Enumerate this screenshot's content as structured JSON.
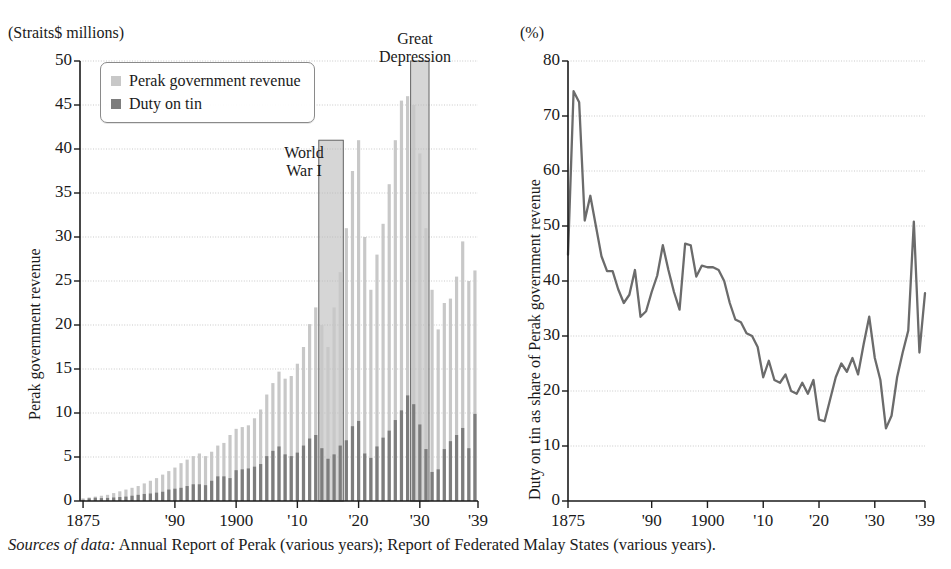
{
  "figure": {
    "source_note_lead": "Sources of data:",
    "source_note_rest": " Annual Report of Perak (various years); Report of Federated Malay States (various years)."
  },
  "colors": {
    "revenue_bar": "#c8c8c8",
    "duty_bar": "#7d7d7d",
    "band_shade": "#b4b4b4",
    "line": "#6b6b6b",
    "axis": "#1a1a1a",
    "grid": "#c9c9c9"
  },
  "left_panel": {
    "unit_label": "(Straits$ millions)",
    "y_axis_title": "Perak government revenue",
    "legend": [
      {
        "label": "Perak government revenue",
        "color_key": "revenue_bar"
      },
      {
        "label": "Duty on tin",
        "color_key": "duty_bar"
      }
    ],
    "annotations": [
      {
        "name": "world-war-one",
        "lines": [
          "World",
          "War I"
        ]
      },
      {
        "name": "great-depression",
        "lines": [
          "Great",
          "Depression"
        ]
      }
    ]
  },
  "right_panel": {
    "unit_label": "(%)",
    "y_axis_title": "Duty on tin as share of Perak government revenue"
  },
  "chart_data": [
    {
      "type": "bar",
      "name": "perak-revenue-and-tin-duty",
      "title": "",
      "xlabel": "",
      "ylabel": "Perak government revenue",
      "unit": "Straits$ millions",
      "ylim": [
        0,
        50
      ],
      "yticks": [
        0,
        5,
        10,
        15,
        20,
        25,
        30,
        35,
        40,
        45,
        50
      ],
      "ytick_labels": [
        "0",
        "5",
        "10",
        "15",
        "20",
        "25",
        "30",
        "35",
        "40",
        "45",
        "50"
      ],
      "xlim": [
        1875,
        1939
      ],
      "xticks": [
        1875,
        1890,
        1900,
        1910,
        1920,
        1930,
        1939
      ],
      "xtick_labels": [
        "1875",
        "'90",
        "1900",
        "'10",
        "'20",
        "'30",
        "'39"
      ],
      "grid": true,
      "legend_position": "upper-left",
      "shaded_bands": [
        {
          "label": "World War I",
          "x_start": 1914,
          "x_end": 1918,
          "y_top": 41
        },
        {
          "label": "Great Depression",
          "x_start": 1929,
          "x_end": 1932,
          "y_top": 50
        }
      ],
      "x": [
        1875,
        1876,
        1877,
        1878,
        1879,
        1880,
        1881,
        1882,
        1883,
        1884,
        1885,
        1886,
        1887,
        1888,
        1889,
        1890,
        1891,
        1892,
        1893,
        1894,
        1895,
        1896,
        1897,
        1898,
        1899,
        1900,
        1901,
        1902,
        1903,
        1904,
        1905,
        1906,
        1907,
        1908,
        1909,
        1910,
        1911,
        1912,
        1913,
        1914,
        1915,
        1916,
        1917,
        1918,
        1919,
        1920,
        1921,
        1922,
        1923,
        1924,
        1925,
        1926,
        1927,
        1928,
        1929,
        1930,
        1931,
        1932,
        1933,
        1934,
        1935,
        1936,
        1937,
        1938,
        1939
      ],
      "series": [
        {
          "name": "Perak government revenue",
          "color_key": "revenue_bar",
          "values": [
            0.3,
            0.4,
            0.5,
            0.6,
            0.7,
            0.9,
            1.1,
            1.3,
            1.5,
            1.7,
            2.0,
            2.3,
            2.6,
            3.0,
            3.4,
            3.8,
            4.3,
            4.7,
            5.1,
            5.4,
            5.1,
            5.6,
            6.3,
            6.6,
            7.5,
            8.2,
            8.4,
            8.6,
            9.4,
            10.4,
            12.1,
            13.4,
            14.7,
            13.9,
            14.2,
            15.6,
            17.5,
            20.1,
            22.0,
            20.0,
            17.5,
            22.0,
            26.0,
            31.0,
            37.5,
            41.0,
            30.0,
            24.0,
            28.0,
            31.5,
            36.0,
            41.0,
            45.5,
            46.0,
            45.0,
            39.5,
            31.0,
            24.0,
            19.5,
            22.5,
            23.0,
            25.5,
            29.5,
            25.0,
            26.2
          ]
        },
        {
          "name": "Duty on tin",
          "color_key": "duty_bar",
          "values": [
            0.14,
            0.3,
            0.37,
            0.33,
            0.35,
            0.4,
            0.45,
            0.5,
            0.6,
            0.7,
            0.8,
            0.85,
            0.95,
            1.05,
            1.3,
            1.4,
            1.5,
            1.7,
            1.9,
            1.9,
            1.8,
            2.3,
            2.8,
            2.8,
            2.6,
            3.5,
            3.6,
            3.7,
            3.9,
            4.2,
            5.1,
            5.7,
            6.2,
            5.3,
            5.1,
            5.5,
            6.3,
            7.1,
            7.5,
            6.0,
            4.8,
            5.3,
            6.3,
            6.9,
            8.5,
            9.1,
            5.4,
            4.9,
            6.2,
            7.2,
            8.0,
            9.2,
            10.3,
            12.0,
            11.0,
            8.7,
            5.9,
            3.3,
            3.6,
            5.9,
            6.8,
            7.5,
            8.3,
            6.0,
            9.9
          ]
        }
      ]
    },
    {
      "type": "line",
      "name": "duty-share-of-revenue",
      "title": "",
      "xlabel": "",
      "ylabel": "Duty on tin as share of Perak government revenue",
      "unit": "%",
      "ylim": [
        0,
        80
      ],
      "yticks": [
        0,
        10,
        20,
        30,
        40,
        50,
        60,
        70,
        80
      ],
      "ytick_labels": [
        "0",
        "10",
        "20",
        "30",
        "40",
        "50",
        "60",
        "70",
        "80"
      ],
      "xlim": [
        1875,
        1939
      ],
      "xticks": [
        1875,
        1890,
        1900,
        1910,
        1920,
        1930,
        1939
      ],
      "xtick_labels": [
        "1875",
        "'90",
        "1900",
        "'10",
        "'20",
        "'30",
        "'39"
      ],
      "grid": true,
      "x": [
        1875,
        1876,
        1877,
        1878,
        1879,
        1880,
        1881,
        1882,
        1883,
        1884,
        1885,
        1886,
        1887,
        1888,
        1889,
        1890,
        1891,
        1892,
        1893,
        1894,
        1895,
        1896,
        1897,
        1898,
        1899,
        1900,
        1901,
        1902,
        1903,
        1904,
        1905,
        1906,
        1907,
        1908,
        1909,
        1910,
        1911,
        1912,
        1913,
        1914,
        1915,
        1916,
        1917,
        1918,
        1919,
        1920,
        1921,
        1922,
        1923,
        1924,
        1925,
        1926,
        1927,
        1928,
        1929,
        1930,
        1931,
        1932,
        1933,
        1934,
        1935,
        1936,
        1937,
        1938,
        1939
      ],
      "values": [
        44.8,
        74.5,
        72.5,
        51.0,
        55.5,
        50.0,
        44.5,
        41.8,
        41.8,
        38.5,
        36.0,
        37.5,
        42.0,
        33.5,
        34.5,
        38.0,
        41.0,
        46.5,
        42.0,
        38.0,
        34.8,
        46.8,
        46.5,
        40.8,
        42.8,
        42.5,
        42.5,
        42.0,
        40.0,
        36.0,
        33.0,
        32.5,
        30.5,
        30.0,
        28.0,
        22.5,
        25.5,
        22.0,
        21.5,
        23.0,
        20.0,
        19.5,
        21.5,
        19.5,
        22.0,
        14.8,
        14.5,
        18.5,
        22.5,
        25.0,
        23.5,
        26.0,
        23.0,
        28.5,
        33.5,
        26.0,
        22.0,
        13.2,
        15.5,
        22.5,
        27.0,
        31.0,
        50.8,
        27.0,
        37.8
      ]
    }
  ]
}
